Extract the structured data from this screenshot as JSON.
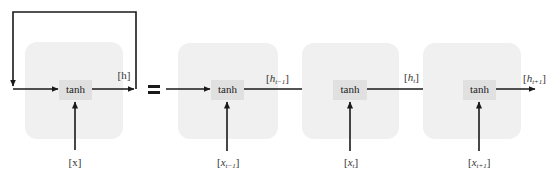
{
  "diagram": {
    "type": "rnn-unrolled",
    "colors": {
      "cell_background": "#f0f0f0",
      "tanh_box": "#e0e0e0",
      "arrows": "#1a1a1a",
      "text": "#333333"
    },
    "folded": {
      "activation": "tanh",
      "input_label": "[x]",
      "hidden_label": "[h]"
    },
    "equals_symbol": "=",
    "unrolled": [
      {
        "activation": "tanh",
        "input_base": "x",
        "input_sub": "t−1",
        "output_base": "h",
        "output_sub": "t−1"
      },
      {
        "activation": "tanh",
        "input_base": "x",
        "input_sub": "t",
        "output_base": "h",
        "output_sub": "t"
      },
      {
        "activation": "tanh",
        "input_base": "x",
        "input_sub": "t+1",
        "output_base": "h",
        "output_sub": "t+1"
      }
    ],
    "labels": {
      "bracket_open": "[",
      "bracket_close": "]"
    }
  }
}
